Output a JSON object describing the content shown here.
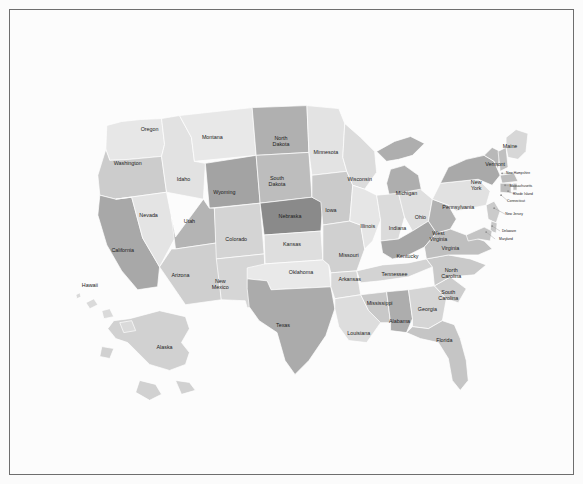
{
  "page": {
    "background_color": "#fbfbfb",
    "frame_border_color": "#6e6e6e",
    "map_background_color": "#fcfcfc",
    "state_border_color": "#ffffff",
    "label_color": "#1b1b1b"
  },
  "chart_data": {
    "type": "choropleth",
    "title": "",
    "subtitle": "",
    "xlabel": "",
    "ylabel": "",
    "legend": [],
    "grid": false,
    "projection": "albers-usa",
    "colorscale": "grayscale",
    "palette": {
      "lightest": "#eaeaea",
      "light": "#e0e0e0",
      "medium_light": "#d2d2d2",
      "medium": "#c2c2c2",
      "medium_dark": "#aaaaaa",
      "dark": "#949494",
      "darkest": "#7e7e7e"
    },
    "categories": [
      "Alabama",
      "Alaska",
      "Arizona",
      "Arkansas",
      "California",
      "Colorado",
      "Connecticut",
      "Delaware",
      "Florida",
      "Georgia",
      "Hawaii",
      "Idaho",
      "Illinois",
      "Indiana",
      "Iowa",
      "Kansas",
      "Kentucky",
      "Louisiana",
      "Maine",
      "Maryland",
      "Massachusetts",
      "Michigan",
      "Minnesota",
      "Mississippi",
      "Missouri",
      "Montana",
      "Nebraska",
      "Nevada",
      "New Hampshire",
      "New Jersey",
      "New Mexico",
      "New York",
      "North Carolina",
      "North Dakota",
      "Ohio",
      "Oklahoma",
      "Oregon",
      "Pennsylvania",
      "Rhode Island",
      "South Carolina",
      "South Dakota",
      "Tennessee",
      "Texas",
      "Utah",
      "Vermont",
      "Virginia",
      "Washington",
      "West Virginia",
      "Wisconsin",
      "Wyoming"
    ],
    "values": [
      0.62,
      0.3,
      0.44,
      0.34,
      0.7,
      0.36,
      0.52,
      0.48,
      0.42,
      0.3,
      0.18,
      0.22,
      0.2,
      0.34,
      0.44,
      0.28,
      0.66,
      0.24,
      0.26,
      0.46,
      0.52,
      0.68,
      0.26,
      0.48,
      0.38,
      0.22,
      0.92,
      0.2,
      0.5,
      0.44,
      0.3,
      0.7,
      0.46,
      0.58,
      0.3,
      0.18,
      0.48,
      0.24,
      0.52,
      0.38,
      0.54,
      0.32,
      0.64,
      0.58,
      0.6,
      0.4,
      0.16,
      0.66,
      0.28,
      0.8
    ]
  },
  "states": [
    {
      "id": "washington",
      "name": "Washington",
      "fill": "#e7e7e7",
      "label_size": "lbl-md",
      "lx": 118,
      "ly": 154
    },
    {
      "id": "oregon",
      "name": "Oregon",
      "fill": "#cccccc",
      "label_size": "lbl-md",
      "lx": 140,
      "ly": 120
    },
    {
      "id": "california",
      "name": "California",
      "fill": "#a8a8a8",
      "label_size": "lbl-md",
      "lx": 113,
      "ly": 242
    },
    {
      "id": "nevada",
      "name": "Nevada",
      "fill": "#e4e4e4",
      "label_size": "lbl-md",
      "lx": 139,
      "ly": 206
    },
    {
      "id": "idaho",
      "name": "Idaho",
      "fill": "#e2e2e2",
      "label_size": "lbl-md",
      "lx": 174,
      "ly": 170
    },
    {
      "id": "montana",
      "name": "Montana",
      "fill": "#e8e8e8",
      "label_size": "lbl-md",
      "lx": 203,
      "ly": 128
    },
    {
      "id": "wyoming",
      "name": "Wyoming",
      "fill": "#a3a3a3",
      "label_size": "lbl-md",
      "lx": 215,
      "ly": 183
    },
    {
      "id": "utah",
      "name": "Utah",
      "fill": "#b4b4b4",
      "label_size": "lbl-md",
      "lx": 180,
      "ly": 212
    },
    {
      "id": "arizona",
      "name": "Arizona",
      "fill": "#cfcfcf",
      "label_size": "lbl-md",
      "lx": 171,
      "ly": 267
    },
    {
      "id": "colorado",
      "name": "Colorado",
      "fill": "#d4d4d4",
      "label_size": "lbl-md",
      "lx": 227,
      "ly": 231
    },
    {
      "id": "new-mexico",
      "name": "New Mexico",
      "fill": "#d6d6d6",
      "label_size": "lbl-md",
      "lx": 211,
      "ly": 276
    },
    {
      "id": "north-dakota",
      "name": "North Dakota",
      "fill": "#b0b0b0",
      "label_size": "lbl-md",
      "lx": 272,
      "ly": 133
    },
    {
      "id": "south-dakota",
      "name": "South Dakota",
      "fill": "#bdbdbd",
      "label_size": "lbl-md",
      "lx": 268,
      "ly": 173
    },
    {
      "id": "nebraska",
      "name": "Nebraska",
      "fill": "#8a8a8a",
      "label_size": "lbl-md",
      "lx": 281,
      "ly": 207
    },
    {
      "id": "kansas",
      "name": "Kansas",
      "fill": "#dedede",
      "label_size": "lbl-md",
      "lx": 283,
      "ly": 236
    },
    {
      "id": "oklahoma",
      "name": "Oklahoma",
      "fill": "#e9e9e9",
      "label_size": "lbl-md",
      "lx": 292,
      "ly": 264
    },
    {
      "id": "texas",
      "name": "Texas",
      "fill": "#ababab",
      "label_size": "lbl-md",
      "lx": 274,
      "ly": 317
    },
    {
      "id": "minnesota",
      "name": "Minnesota",
      "fill": "#e3e3e3",
      "label_size": "lbl-md",
      "lx": 317,
      "ly": 143
    },
    {
      "id": "iowa",
      "name": "Iowa",
      "fill": "#cacaca",
      "label_size": "lbl-md",
      "lx": 322,
      "ly": 201
    },
    {
      "id": "missouri",
      "name": "Missouri",
      "fill": "#d0d0d0",
      "label_size": "lbl-md",
      "lx": 340,
      "ly": 247
    },
    {
      "id": "arkansas",
      "name": "Arkansas",
      "fill": "#d8d8d8",
      "label_size": "lbl-md",
      "lx": 341,
      "ly": 271
    },
    {
      "id": "louisiana",
      "name": "Louisiana",
      "fill": "#dddddd",
      "label_size": "lbl-md",
      "lx": 350,
      "ly": 325
    },
    {
      "id": "wisconsin",
      "name": "Wisconsin",
      "fill": "#dcdcdc",
      "label_size": "lbl-md",
      "lx": 351,
      "ly": 170
    },
    {
      "id": "illinois",
      "name": "Illinois",
      "fill": "#e6e6e6",
      "label_size": "lbl-md",
      "lx": 359,
      "ly": 218
    },
    {
      "id": "mississippi",
      "name": "Mississippi",
      "fill": "#c8c8c8",
      "label_size": "lbl-md",
      "lx": 371,
      "ly": 295
    },
    {
      "id": "michigan",
      "name": "Michigan",
      "fill": "#aeaeae",
      "label_size": "lbl-md",
      "lx": 398,
      "ly": 184
    },
    {
      "id": "indiana",
      "name": "Indiana",
      "fill": "#dbdbdb",
      "label_size": "lbl-md",
      "lx": 389,
      "ly": 220
    },
    {
      "id": "alabama",
      "name": "Alabama",
      "fill": "#adadad",
      "label_size": "lbl-md",
      "lx": 391,
      "ly": 313
    },
    {
      "id": "ohio",
      "name": "Ohio",
      "fill": "#dfdfdf",
      "label_size": "lbl-md",
      "lx": 412,
      "ly": 208
    },
    {
      "id": "kentucky",
      "name": "Kentucky",
      "fill": "#a6a6a6",
      "label_size": "lbl-md",
      "lx": 399,
      "ly": 248
    },
    {
      "id": "tennessee",
      "name": "Tennessee",
      "fill": "#d3d3d3",
      "label_size": "lbl-md",
      "lx": 386,
      "ly": 266
    },
    {
      "id": "georgia",
      "name": "Georgia",
      "fill": "#d5d5d5",
      "label_size": "lbl-md",
      "lx": 419,
      "ly": 301
    },
    {
      "id": "florida",
      "name": "Florida",
      "fill": "#c5c5c5",
      "label_size": "lbl-md",
      "lx": 436,
      "ly": 332
    },
    {
      "id": "south-carolina",
      "name": "South Carolina",
      "fill": "#cdcdcd",
      "label_size": "lbl-md",
      "lx": 440,
      "ly": 287
    },
    {
      "id": "north-carolina",
      "name": "North Carolina",
      "fill": "#c9c9c9",
      "label_size": "lbl-md",
      "lx": 443,
      "ly": 265
    },
    {
      "id": "virginia",
      "name": "Virginia",
      "fill": "#bfbfbf",
      "label_size": "lbl-md",
      "lx": 442,
      "ly": 240
    },
    {
      "id": "west-virginia",
      "name": "West Virginia",
      "fill": "#b2b2b2",
      "label_size": "lbl-md",
      "lx": 430,
      "ly": 228
    },
    {
      "id": "pennsylvania",
      "name": "Pennsylvania",
      "fill": "#e1e1e1",
      "label_size": "lbl-md",
      "lx": 450,
      "ly": 198
    },
    {
      "id": "new-york",
      "name": "New York",
      "fill": "#a9a9a9",
      "label_size": "lbl-md",
      "lx": 468,
      "ly": 177
    },
    {
      "id": "vermont",
      "name": "Vermont",
      "fill": "#b8b8b8",
      "label_size": "lbl-md",
      "lx": 487,
      "ly": 155
    },
    {
      "id": "maine",
      "name": "Maine",
      "fill": "#d7d7d7",
      "label_size": "lbl-md",
      "lx": 502,
      "ly": 137
    },
    {
      "id": "hawaii",
      "name": "Hawaii",
      "fill": "#dadada",
      "label_size": "lbl-md",
      "lx": 80,
      "ly": 277
    },
    {
      "id": "alaska",
      "name": "Alaska",
      "fill": "#d1d1d1",
      "label_size": "lbl-md",
      "lx": 155,
      "ly": 339
    }
  ],
  "small_states": [
    {
      "id": "new-hampshire",
      "name": "New Hampshire",
      "label_size": "lbl-xs",
      "lx": 510,
      "ly": 164,
      "dot_x": 494,
      "dot_y": 164
    },
    {
      "id": "massachusetts",
      "name": "Massachusetts",
      "label_size": "lbl-xs",
      "lx": 513,
      "ly": 177,
      "dot_x": 497,
      "dot_y": 176
    },
    {
      "id": "rhode-island",
      "name": "Rhode Island",
      "label_size": "lbl-xs",
      "lx": 515,
      "ly": 185,
      "dot_x": 500,
      "dot_y": 182
    },
    {
      "id": "connecticut",
      "name": "Connecticut",
      "label_size": "lbl-xs",
      "lx": 508,
      "ly": 192,
      "dot_x": 493,
      "dot_y": 186
    },
    {
      "id": "new-jersey",
      "name": "New Jersey",
      "label_size": "lbl-xs",
      "lx": 506,
      "ly": 205,
      "dot_x": 486,
      "dot_y": 199
    },
    {
      "id": "delaware",
      "name": "Delaware",
      "label_size": "lbl-xs",
      "lx": 501,
      "ly": 222,
      "dot_x": 484,
      "dot_y": 217
    },
    {
      "id": "maryland",
      "name": "Maryland",
      "label_size": "lbl-xs",
      "lx": 498,
      "ly": 230,
      "dot_x": 478,
      "dot_y": 223
    }
  ]
}
